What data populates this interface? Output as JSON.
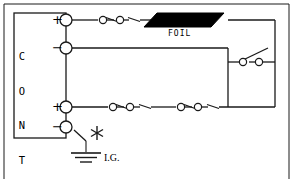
{
  "diagram": {
    "stroke_color": "#1a1a1a",
    "fill_black": "#000000",
    "background": "#ffffff"
  },
  "control_box": {
    "label": "CONTROL",
    "letters": [
      "C",
      "O",
      "N",
      "T",
      "R",
      "O",
      "L"
    ]
  },
  "terminals": [
    {
      "id": "terminal-1",
      "sign": "+",
      "row": 1
    },
    {
      "id": "terminal-2",
      "sign": "−",
      "row": 2
    },
    {
      "id": "terminal-3",
      "sign": "+",
      "row": 3
    },
    {
      "id": "terminal-4",
      "sign": "−",
      "row": 4
    }
  ],
  "components": {
    "foil": {
      "label": "FOIL",
      "shape": "parallelogram",
      "fill": "#000000"
    },
    "ground": {
      "label": "I.G.",
      "type": "isolated-ground",
      "bars": 3
    },
    "asterisk": {
      "name": "asterisk-marker",
      "points": 6
    }
  },
  "switches": [
    {
      "id": "switch-row1-a",
      "row": 1,
      "state": "closed"
    },
    {
      "id": "switch-row1-b",
      "row": 1,
      "state": "closed"
    },
    {
      "id": "switch-row3-a",
      "row": 3,
      "state": "closed"
    },
    {
      "id": "switch-row3-b",
      "row": 3,
      "state": "closed"
    },
    {
      "id": "switch-row3-c",
      "row": 3,
      "state": "closed"
    },
    {
      "id": "switch-row3-d",
      "row": 3,
      "state": "closed"
    },
    {
      "id": "switch-right",
      "row": 2,
      "state": "open"
    },
    {
      "id": "switch-ground",
      "row": 4,
      "state": "closed"
    }
  ]
}
